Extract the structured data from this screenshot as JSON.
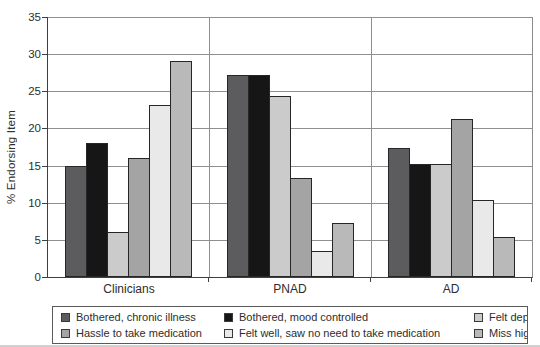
{
  "chart_data": {
    "type": "bar",
    "title": "",
    "xlabel": "",
    "ylabel": "% Endorsing Item",
    "ylim": [
      0,
      35
    ],
    "yticks": [
      0,
      5,
      10,
      15,
      20,
      25,
      30,
      35
    ],
    "grid": true,
    "legend_position": "bottom",
    "categories": [
      "Clinicians",
      "PNAD",
      "AD"
    ],
    "series": [
      {
        "name": "Bothered, chronic illness",
        "color": "#5c5c5e",
        "values": [
          15.0,
          27.2,
          17.4
        ]
      },
      {
        "name": "Bothered, mood controlled",
        "color": "#161616",
        "values": [
          18.0,
          27.2,
          15.2
        ]
      },
      {
        "name": "Felt depressed",
        "color": "#cbcbcb",
        "values": [
          6.0,
          24.3,
          15.2
        ]
      },
      {
        "name": "Hassle to take medication",
        "color": "#a4a4a4",
        "values": [
          16.0,
          13.3,
          21.3
        ]
      },
      {
        "name": "Felt well, saw no need to take medication",
        "color": "#e9e9e9",
        "values": [
          23.1,
          3.5,
          10.3
        ]
      },
      {
        "name": "Miss highs",
        "color": "#b9b9b9",
        "values": [
          29.1,
          7.3,
          5.4
        ]
      }
    ]
  }
}
